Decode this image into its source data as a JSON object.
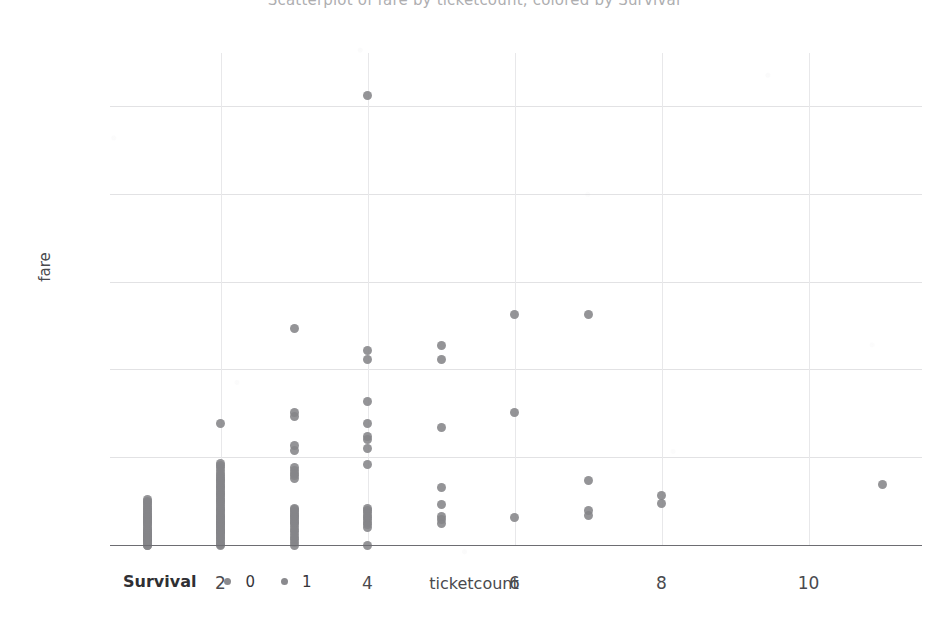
{
  "title": "Scatterplot of fare by ticketcount, colored by Survival",
  "axis": {
    "ylabel": "fare",
    "xlabel": "ticketcount",
    "yticks": [
      "0",
      "100",
      "200",
      "300",
      "400",
      "500"
    ],
    "xticks": [
      "2",
      "4",
      "6",
      "8",
      "10"
    ]
  },
  "legend": {
    "title": "Survival",
    "entries": [
      {
        "label": "0",
        "color": "#8a8a8e"
      },
      {
        "label": "1",
        "color": "#8a8a8e"
      }
    ]
  },
  "colors": {
    "point": "#858589",
    "gridline": "#e2e2e4",
    "axis": "#6d6d72",
    "text": "#4a4a4e"
  },
  "chart_data": {
    "type": "scatter",
    "title": "Scatterplot of fare by ticketcount, colored by Survival",
    "xlabel": "ticketcount",
    "ylabel": "fare",
    "xlim": [
      0.4,
      11.6
    ],
    "ylim": [
      -18,
      530
    ],
    "xticks": [
      2,
      4,
      6,
      8,
      10
    ],
    "yticks": [
      0,
      100,
      200,
      300,
      400,
      500
    ],
    "grid": true,
    "legend": {
      "title": "Survival",
      "position": "bottom-left",
      "entries": [
        "0",
        "1"
      ]
    },
    "series": [
      {
        "name": "Survival",
        "points": [
          {
            "x": 1,
            "y": 0
          },
          {
            "x": 1,
            "y": 0
          },
          {
            "x": 1,
            "y": 2
          },
          {
            "x": 1,
            "y": 4
          },
          {
            "x": 1,
            "y": 5
          },
          {
            "x": 1,
            "y": 6
          },
          {
            "x": 1,
            "y": 7
          },
          {
            "x": 1,
            "y": 7
          },
          {
            "x": 1,
            "y": 8
          },
          {
            "x": 1,
            "y": 8
          },
          {
            "x": 1,
            "y": 9
          },
          {
            "x": 1,
            "y": 10
          },
          {
            "x": 1,
            "y": 12
          },
          {
            "x": 1,
            "y": 13
          },
          {
            "x": 1,
            "y": 14
          },
          {
            "x": 1,
            "y": 15
          },
          {
            "x": 1,
            "y": 16
          },
          {
            "x": 1,
            "y": 18
          },
          {
            "x": 1,
            "y": 20
          },
          {
            "x": 1,
            "y": 22
          },
          {
            "x": 1,
            "y": 24
          },
          {
            "x": 1,
            "y": 26
          },
          {
            "x": 1,
            "y": 27
          },
          {
            "x": 1,
            "y": 29
          },
          {
            "x": 1,
            "y": 30
          },
          {
            "x": 1,
            "y": 31
          },
          {
            "x": 1,
            "y": 33
          },
          {
            "x": 1,
            "y": 35
          },
          {
            "x": 1,
            "y": 36
          },
          {
            "x": 1,
            "y": 38
          },
          {
            "x": 1,
            "y": 40
          },
          {
            "x": 1,
            "y": 42
          },
          {
            "x": 1,
            "y": 44
          },
          {
            "x": 1,
            "y": 46
          },
          {
            "x": 1,
            "y": 48
          },
          {
            "x": 1,
            "y": 50
          },
          {
            "x": 1,
            "y": 52
          },
          {
            "x": 2,
            "y": 0
          },
          {
            "x": 2,
            "y": 1
          },
          {
            "x": 2,
            "y": 3
          },
          {
            "x": 2,
            "y": 5
          },
          {
            "x": 2,
            "y": 7
          },
          {
            "x": 2,
            "y": 9
          },
          {
            "x": 2,
            "y": 11
          },
          {
            "x": 2,
            "y": 13
          },
          {
            "x": 2,
            "y": 14
          },
          {
            "x": 2,
            "y": 15
          },
          {
            "x": 2,
            "y": 16
          },
          {
            "x": 2,
            "y": 18
          },
          {
            "x": 2,
            "y": 20
          },
          {
            "x": 2,
            "y": 21
          },
          {
            "x": 2,
            "y": 23
          },
          {
            "x": 2,
            "y": 24
          },
          {
            "x": 2,
            "y": 26
          },
          {
            "x": 2,
            "y": 27
          },
          {
            "x": 2,
            "y": 29
          },
          {
            "x": 2,
            "y": 30
          },
          {
            "x": 2,
            "y": 32
          },
          {
            "x": 2,
            "y": 33
          },
          {
            "x": 2,
            "y": 35
          },
          {
            "x": 2,
            "y": 37
          },
          {
            "x": 2,
            "y": 39
          },
          {
            "x": 2,
            "y": 41
          },
          {
            "x": 2,
            "y": 43
          },
          {
            "x": 2,
            "y": 45
          },
          {
            "x": 2,
            "y": 47
          },
          {
            "x": 2,
            "y": 49
          },
          {
            "x": 2,
            "y": 51
          },
          {
            "x": 2,
            "y": 53
          },
          {
            "x": 2,
            "y": 55
          },
          {
            "x": 2,
            "y": 57
          },
          {
            "x": 2,
            "y": 59
          },
          {
            "x": 2,
            "y": 61
          },
          {
            "x": 2,
            "y": 63
          },
          {
            "x": 2,
            "y": 65
          },
          {
            "x": 2,
            "y": 67
          },
          {
            "x": 2,
            "y": 69
          },
          {
            "x": 2,
            "y": 71
          },
          {
            "x": 2,
            "y": 73
          },
          {
            "x": 2,
            "y": 75
          },
          {
            "x": 2,
            "y": 77
          },
          {
            "x": 2,
            "y": 79
          },
          {
            "x": 2,
            "y": 82
          },
          {
            "x": 2,
            "y": 85
          },
          {
            "x": 2,
            "y": 88
          },
          {
            "x": 2,
            "y": 91
          },
          {
            "x": 2,
            "y": 93
          },
          {
            "x": 2,
            "y": 138
          },
          {
            "x": 3,
            "y": 0
          },
          {
            "x": 3,
            "y": 3
          },
          {
            "x": 3,
            "y": 6
          },
          {
            "x": 3,
            "y": 9
          },
          {
            "x": 3,
            "y": 12
          },
          {
            "x": 3,
            "y": 15
          },
          {
            "x": 3,
            "y": 18
          },
          {
            "x": 3,
            "y": 21
          },
          {
            "x": 3,
            "y": 24
          },
          {
            "x": 3,
            "y": 26
          },
          {
            "x": 3,
            "y": 28
          },
          {
            "x": 3,
            "y": 30
          },
          {
            "x": 3,
            "y": 32
          },
          {
            "x": 3,
            "y": 34
          },
          {
            "x": 3,
            "y": 36
          },
          {
            "x": 3,
            "y": 38
          },
          {
            "x": 3,
            "y": 40
          },
          {
            "x": 3,
            "y": 42
          },
          {
            "x": 3,
            "y": 76
          },
          {
            "x": 3,
            "y": 79
          },
          {
            "x": 3,
            "y": 82
          },
          {
            "x": 3,
            "y": 85
          },
          {
            "x": 3,
            "y": 88
          },
          {
            "x": 3,
            "y": 108
          },
          {
            "x": 3,
            "y": 113
          },
          {
            "x": 3,
            "y": 146
          },
          {
            "x": 3,
            "y": 151
          },
          {
            "x": 3,
            "y": 247
          },
          {
            "x": 4,
            "y": 0
          },
          {
            "x": 4,
            "y": 20
          },
          {
            "x": 4,
            "y": 23
          },
          {
            "x": 4,
            "y": 26
          },
          {
            "x": 4,
            "y": 29
          },
          {
            "x": 4,
            "y": 31
          },
          {
            "x": 4,
            "y": 34
          },
          {
            "x": 4,
            "y": 37
          },
          {
            "x": 4,
            "y": 39
          },
          {
            "x": 4,
            "y": 42
          },
          {
            "x": 4,
            "y": 92
          },
          {
            "x": 4,
            "y": 110
          },
          {
            "x": 4,
            "y": 120
          },
          {
            "x": 4,
            "y": 124
          },
          {
            "x": 4,
            "y": 138
          },
          {
            "x": 4,
            "y": 164
          },
          {
            "x": 4,
            "y": 211
          },
          {
            "x": 4,
            "y": 221
          },
          {
            "x": 4,
            "y": 512
          },
          {
            "x": 5,
            "y": 25
          },
          {
            "x": 5,
            "y": 29
          },
          {
            "x": 5,
            "y": 32
          },
          {
            "x": 5,
            "y": 46
          },
          {
            "x": 5,
            "y": 65
          },
          {
            "x": 5,
            "y": 134
          },
          {
            "x": 5,
            "y": 211
          },
          {
            "x": 5,
            "y": 227
          },
          {
            "x": 6,
            "y": 31
          },
          {
            "x": 6,
            "y": 151
          },
          {
            "x": 6,
            "y": 262
          },
          {
            "x": 7,
            "y": 34
          },
          {
            "x": 7,
            "y": 39
          },
          {
            "x": 7,
            "y": 73
          },
          {
            "x": 7,
            "y": 262
          },
          {
            "x": 8,
            "y": 47
          },
          {
            "x": 8,
            "y": 56
          },
          {
            "x": 11,
            "y": 69
          }
        ]
      }
    ]
  }
}
